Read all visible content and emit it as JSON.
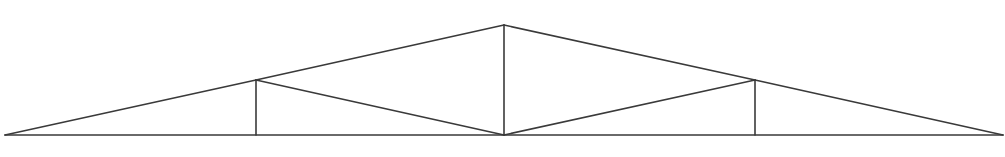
{
  "diagram": {
    "type": "roof-truss",
    "canvas": {
      "width": 1005,
      "height": 157,
      "background": "#ffffff"
    },
    "line_color": "#3a3a3a",
    "line_width": 1.6,
    "nodes": {
      "left_support": {
        "x": 5,
        "y": 135
      },
      "left_panel": {
        "x": 256,
        "y": 80
      },
      "apex": {
        "x": 504,
        "y": 25
      },
      "right_panel": {
        "x": 755,
        "y": 80
      },
      "right_support": {
        "x": 1003,
        "y": 135
      },
      "left_bottom": {
        "x": 256,
        "y": 135
      },
      "center_bottom": {
        "x": 504,
        "y": 135
      },
      "right_bottom": {
        "x": 755,
        "y": 135
      }
    },
    "members": [
      {
        "name": "bottom-chord",
        "from": "left_support",
        "to": "right_support"
      },
      {
        "name": "top-chord-left-1",
        "from": "left_support",
        "to": "left_panel"
      },
      {
        "name": "top-chord-left-2",
        "from": "left_panel",
        "to": "apex"
      },
      {
        "name": "top-chord-right-1",
        "from": "apex",
        "to": "right_panel"
      },
      {
        "name": "top-chord-right-2",
        "from": "right_panel",
        "to": "right_support"
      },
      {
        "name": "king-post",
        "from": "apex",
        "to": "center_bottom"
      },
      {
        "name": "left-vertical",
        "from": "left_panel",
        "to": "left_bottom"
      },
      {
        "name": "right-vertical",
        "from": "right_panel",
        "to": "right_bottom"
      },
      {
        "name": "left-diagonal",
        "from": "left_panel",
        "to": "center_bottom"
      },
      {
        "name": "right-diagonal",
        "from": "center_bottom",
        "to": "right_panel"
      }
    ]
  }
}
